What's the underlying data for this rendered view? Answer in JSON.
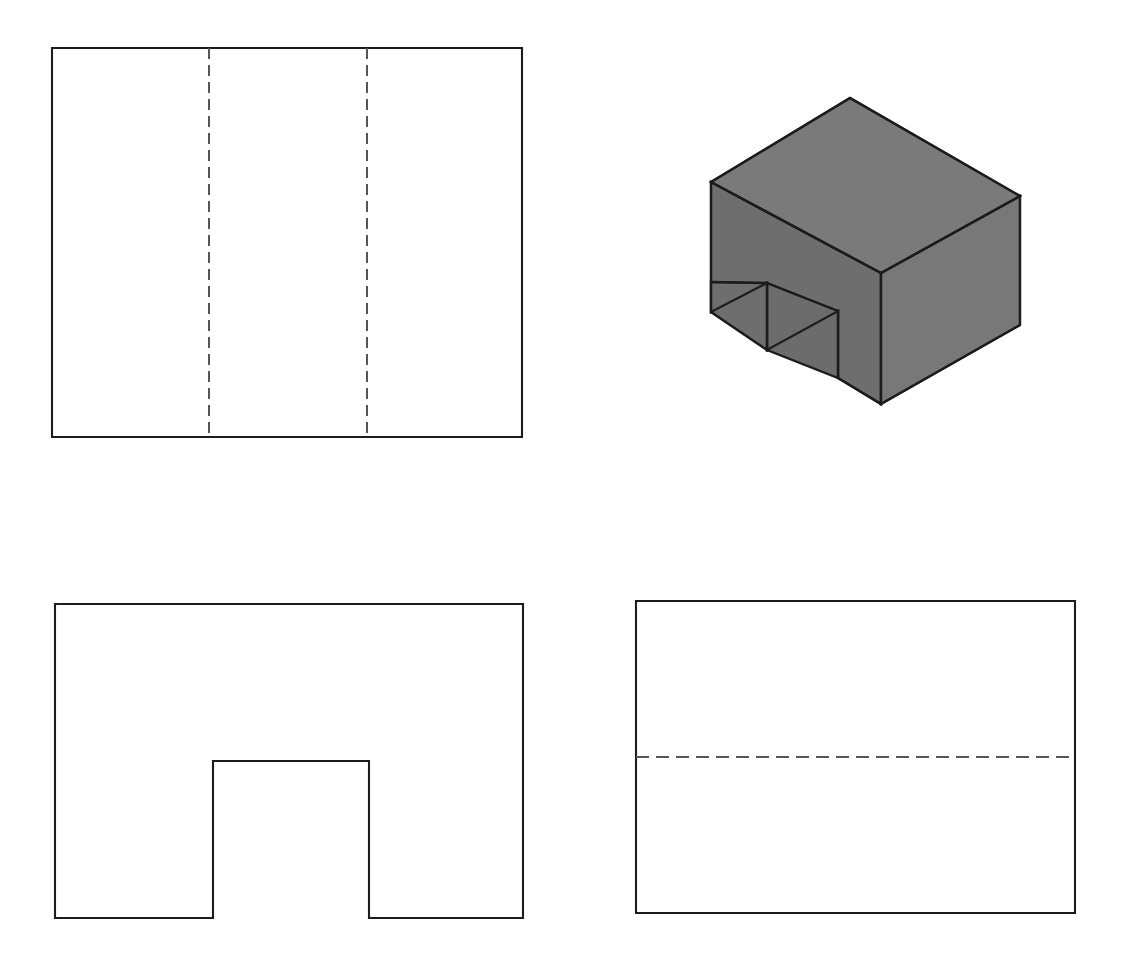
{
  "page": {
    "width": 1132,
    "height": 967,
    "background_color": "#ffffff"
  },
  "style": {
    "visible_line_color": "#1c1c1c",
    "hidden_line_color": "#555555",
    "solid_fill_color": "#767676",
    "visible_line_width": 2.1,
    "hidden_line_width": 2.0,
    "hidden_dash_pattern": "11 6"
  },
  "views": [
    {
      "id": "top-view",
      "name": "top-view",
      "position": "top-left",
      "shape": "rectangle",
      "outline": {
        "x": 52,
        "y": 48,
        "width": 470,
        "height": 389
      },
      "hidden_lines": [
        {
          "orientation": "vertical",
          "x": 209,
          "y1": 48,
          "y2": 437
        },
        {
          "orientation": "vertical",
          "x": 367,
          "y1": 48,
          "y2": 437
        }
      ],
      "outline_path": "M 52 48 L 522 48 L 522 437 L 52 437 Z"
    },
    {
      "id": "pictorial-view",
      "name": "isometric-pictorial-view",
      "position": "top-right",
      "shape": "isometric-solid-with-notch",
      "fill_color": "#767676",
      "faces": [
        {
          "name": "top-face",
          "fill": "#7a7a7a",
          "points": "711,182 850,98 1020,196 881,273"
        },
        {
          "name": "left-face",
          "fill": "#6e6e6e",
          "points": "711,182 881,273 881,404 838,378 838,311 767,350 767,283 711,312"
        },
        {
          "name": "right-face",
          "fill": "#787878",
          "points": "881,273 1020,196 1020,325 881,404"
        },
        {
          "name": "notch-inner-left",
          "fill": "#6a6a6a",
          "points": "767,283 767,350 711,312 711,283"
        },
        {
          "name": "notch-inner-floor",
          "fill": "#727272",
          "points": "767,283 838,311 838,378 767,350"
        }
      ],
      "silhouette_path": "M 711 182 L 850 98 L 1020 196 L 1020 325 L 881 404 L 838 378 L 838 311 L 767 350 L 767 283 L 711 312 Z",
      "internal_edges": [
        "M 711 182 L 881 273 L 1020 196",
        "M 881 273 L 881 404",
        "M 767 283 L 838 311",
        "M 838 311 L 838 378",
        "M 767 283 L 767 350",
        "M 711 283 L 767 283"
      ]
    },
    {
      "id": "front-view",
      "name": "front-view",
      "position": "bottom-left",
      "shape": "rectangle-with-notch",
      "outline": {
        "x": 55,
        "y": 604,
        "width": 468,
        "height": 314
      },
      "notch": {
        "x": 213,
        "y": 761,
        "width": 156,
        "height": 157
      },
      "outline_path": "M 55 604 L 523 604 L 523 918 L 369 918 L 369 761 L 213 761 L 213 918 L 55 918 Z",
      "hidden_lines": []
    },
    {
      "id": "side-view",
      "name": "right-side-view",
      "position": "bottom-right",
      "shape": "rectangle",
      "outline": {
        "x": 636,
        "y": 601,
        "width": 439,
        "height": 312
      },
      "hidden_lines": [
        {
          "orientation": "horizontal",
          "y": 757,
          "x1": 636,
          "x2": 1075
        }
      ],
      "outline_path": "M 636 601 L 1075 601 L 1075 913 L 636 913 Z"
    }
  ]
}
